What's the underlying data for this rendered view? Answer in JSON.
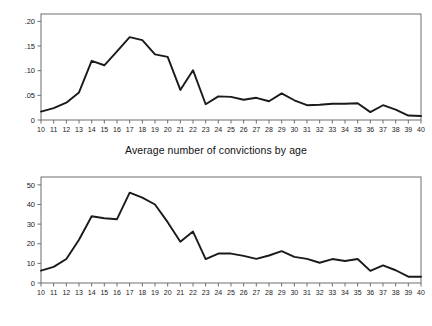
{
  "chart_data": [
    {
      "type": "line",
      "title": "Average number of convictions by age",
      "caption": "Average number of convictions by age",
      "xlabel": "",
      "ylabel": "",
      "x": [
        10,
        11,
        12,
        13,
        14,
        15,
        16,
        17,
        18,
        19,
        20,
        21,
        22,
        23,
        24,
        25,
        26,
        27,
        28,
        29,
        30,
        31,
        32,
        33,
        34,
        35,
        36,
        37,
        38,
        39,
        40
      ],
      "values": [
        0.017,
        0.024,
        0.035,
        0.056,
        0.12,
        0.111,
        0.139,
        0.168,
        0.162,
        0.133,
        0.128,
        0.061,
        0.101,
        0.032,
        0.048,
        0.047,
        0.041,
        0.045,
        0.038,
        0.054,
        0.04,
        0.03,
        0.031,
        0.033,
        0.033,
        0.034,
        0.016,
        0.03,
        0.021,
        0.009,
        0.008
      ],
      "categories": [
        "10",
        "11",
        "12",
        "13",
        "14",
        "15",
        "16",
        "17",
        "18",
        "19",
        "20",
        "21",
        "22",
        "23",
        "24",
        "25",
        "26",
        "27",
        "28",
        "29",
        "30",
        "31",
        "32",
        "33",
        "34",
        "35",
        "36",
        "37",
        "38",
        "39",
        "40"
      ],
      "xtick_labels": [
        "10",
        "11",
        "12",
        "13",
        "14",
        "15",
        "16",
        "17",
        "18",
        "19",
        "20",
        "21",
        "22",
        "23",
        "24",
        "25",
        "26",
        "27",
        "28",
        "29",
        "30",
        "31",
        "32",
        "33",
        "34",
        "35",
        "36",
        "37",
        "38",
        "39",
        "40"
      ],
      "ytick_labels": [
        "0",
        ".05",
        ".10",
        ".15",
        ".20"
      ],
      "ytick_values": [
        0,
        0.05,
        0.1,
        0.15,
        0.2
      ],
      "ylim": [
        0,
        0.215
      ],
      "xlim": [
        10,
        40
      ],
      "grid": false,
      "legend": "none",
      "line_color": "#1a1a1a"
    },
    {
      "type": "line",
      "title": "Number of males with convictions by age",
      "caption": "Number of males with convictions by age",
      "xlabel": "",
      "ylabel": "",
      "x": [
        10,
        11,
        12,
        13,
        14,
        15,
        16,
        17,
        18,
        19,
        20,
        21,
        22,
        23,
        24,
        25,
        26,
        27,
        28,
        29,
        30,
        31,
        32,
        33,
        34,
        35,
        36,
        37,
        38,
        39,
        40
      ],
      "values": [
        6.3,
        8.2,
        12.2,
        22,
        34,
        33,
        32.5,
        46,
        43.5,
        40,
        31,
        21,
        26.2,
        12.2,
        15,
        15,
        13.8,
        12.3,
        14,
        16.2,
        13.3,
        12.3,
        10.3,
        12.2,
        11.2,
        12.2,
        6.2,
        9,
        6.5,
        3.2,
        3.2
      ],
      "categories": [
        "10",
        "11",
        "12",
        "13",
        "14",
        "15",
        "16",
        "17",
        "18",
        "19",
        "20",
        "21",
        "22",
        "23",
        "24",
        "25",
        "26",
        "27",
        "28",
        "29",
        "30",
        "31",
        "32",
        "33",
        "34",
        "35",
        "36",
        "37",
        "38",
        "39",
        "40"
      ],
      "xtick_labels": [
        "10",
        "11",
        "12",
        "13",
        "14",
        "15",
        "16",
        "17",
        "18",
        "19",
        "20",
        "21",
        "22",
        "23",
        "24",
        "25",
        "26",
        "27",
        "28",
        "29",
        "30",
        "31",
        "32",
        "33",
        "34",
        "35",
        "36",
        "37",
        "38",
        "39",
        "40"
      ],
      "ytick_labels": [
        "0",
        "10",
        "20",
        "30",
        "40",
        "50"
      ],
      "ytick_values": [
        0,
        10,
        20,
        30,
        40,
        50
      ],
      "ylim": [
        0,
        54
      ],
      "xlim": [
        10,
        40
      ],
      "grid": false,
      "legend": "none",
      "line_color": "#1a1a1a"
    }
  ],
  "figure": {
    "panels": [
      {
        "caption": "Average number of convictions by age"
      },
      {
        "caption": "Number of males with convictions by age"
      }
    ]
  },
  "colors": {
    "line": "#1a1a1a",
    "axis": "#6e6e6e",
    "text": "#111111",
    "background": "#ffffff"
  }
}
